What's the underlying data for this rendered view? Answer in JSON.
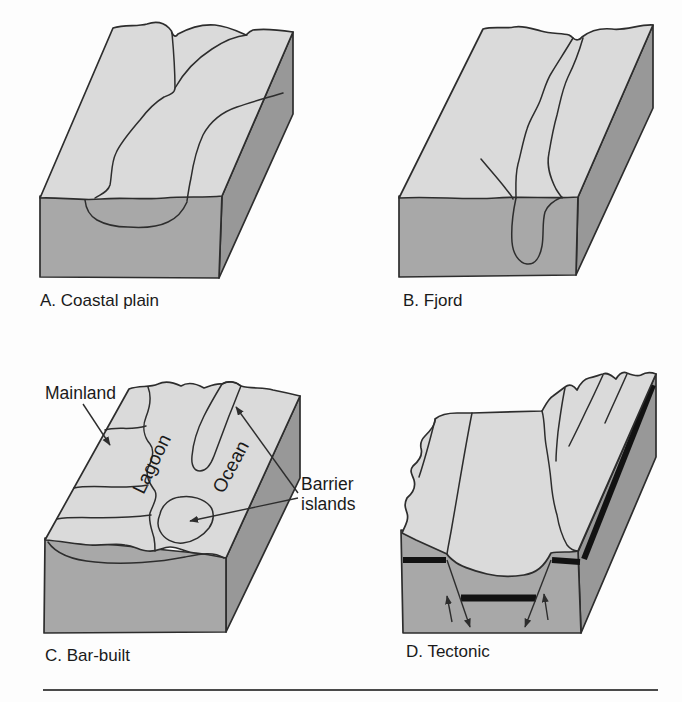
{
  "colors": {
    "background": "#fdfdfd",
    "top-face": "#dadada",
    "front-face": "#a8a8a8",
    "side-face": "#989898",
    "line": "#2d2d2d",
    "band": "#121212",
    "text": "#1a1a1a",
    "rule": "#4a4a4a"
  },
  "figure": {
    "panel_a": {
      "caption": "A. Coastal plain"
    },
    "panel_b": {
      "caption": "B. Fjord"
    },
    "panel_c": {
      "caption": "C. Bar-built",
      "labels": {
        "mainland": "Mainland",
        "lagoon": "Lagoon",
        "ocean": "Ocean",
        "barrier_line1": "Barrier",
        "barrier_line2": "islands"
      }
    },
    "panel_d": {
      "caption": "D. Tectonic"
    }
  }
}
